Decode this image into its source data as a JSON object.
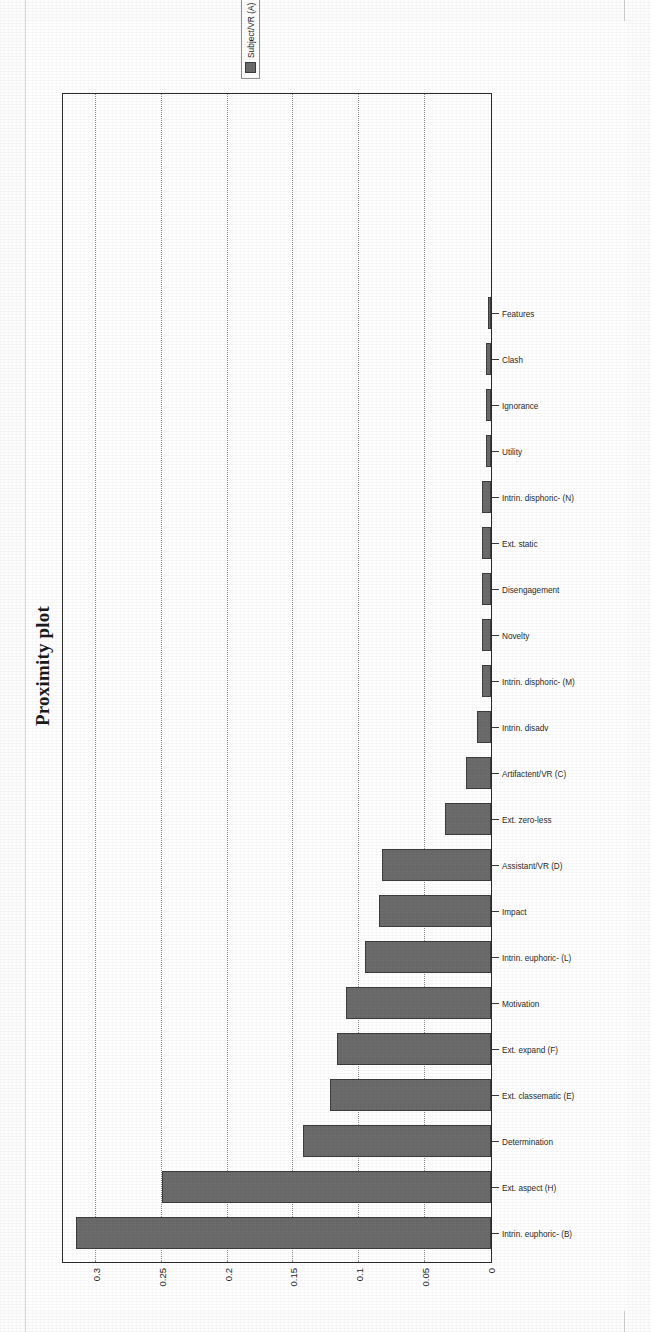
{
  "document": {
    "scan_artifacts": [
      "left-margin-rule",
      "right-margin-rule"
    ]
  },
  "figure": {
    "title": "Proximity plot",
    "rotation_degrees": -90,
    "legend": {
      "position": "right",
      "entries": [
        {
          "label": "Subject/VR (A)",
          "color": "#6b6b6b"
        }
      ]
    }
  },
  "chart_data": {
    "type": "bar",
    "title": "Proximity plot",
    "xlabel": "",
    "ylabel": "",
    "ylim": [
      0,
      0.325
    ],
    "yticks": [
      0,
      0.05,
      0.1,
      0.15,
      0.2,
      0.25,
      0.3
    ],
    "ytick_labels": [
      "0",
      "0.05",
      "0.1",
      "0.15",
      "0.2",
      "0.25",
      "0.3"
    ],
    "grid": true,
    "grid_axis": "y",
    "legend_position": "right",
    "series_name": "Subject/VR (A)",
    "bar_color": "#6b6b6b",
    "categories": [
      "Intrin. euphoric- (B)",
      "Ext. aspect (H)",
      "Determination",
      "Ext. classematic (E)",
      "Ext. expand (F)",
      "Motivation",
      "Intrin. euphoric- (L)",
      "Impact",
      "Assistant/VR (D)",
      "Ext. zero-less",
      "Artifactent/VR (C)",
      "Intrin. disadv",
      "Intrin. disphoric- (M)",
      "Novelty",
      "Disengagement",
      "Ext. static",
      "Intrin. disphoric- (N)",
      "Utility",
      "Ignorance",
      "Clash",
      "Features"
    ],
    "values": [
      0.315,
      0.25,
      0.143,
      0.122,
      0.117,
      0.11,
      0.096,
      0.085,
      0.083,
      0.035,
      0.019,
      0.011,
      0.007,
      0.007,
      0.007,
      0.007,
      0.007,
      0.004,
      0.004,
      0.004,
      0.002
    ]
  }
}
